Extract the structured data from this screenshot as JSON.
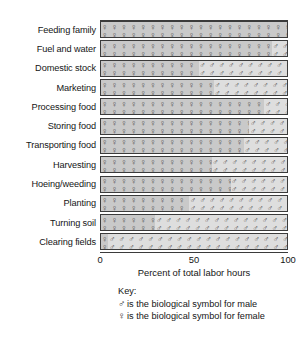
{
  "chart_data": {
    "type": "bar",
    "orientation": "horizontal",
    "stacked": true,
    "title": "",
    "xlabel": "Percent of total labor hours",
    "ylabel": "",
    "xlim": [
      0,
      100
    ],
    "xticks": [
      0,
      50,
      100
    ],
    "xtick_labels": [
      "0",
      "50",
      "100"
    ],
    "grid": false,
    "legend_position": "below-plot",
    "categories": [
      "Feeding family",
      "Fuel and water",
      "Domestic stock",
      "Marketing",
      "Processing food",
      "Storing food",
      "Transporting food",
      "Harvesting",
      "Hoeing/weeding",
      "Planting",
      "Turning soil",
      "Clearing fields"
    ],
    "series": [
      {
        "name": "female",
        "symbol": "♀",
        "values": [
          100,
          92,
          53,
          61,
          88,
          80,
          77,
          60,
          70,
          48,
          30,
          5
        ]
      },
      {
        "name": "male",
        "symbol": "♂",
        "values": [
          0,
          8,
          47,
          39,
          12,
          20,
          23,
          40,
          30,
          52,
          70,
          95
        ]
      }
    ]
  },
  "axis": {
    "xlabel": "Percent of total labor hours",
    "tick_0": "0",
    "tick_50": "50",
    "tick_100": "100"
  },
  "key": {
    "title": "Key:",
    "male_symbol": "♂",
    "male_text": "is the biological symbol for male",
    "female_symbol": "♀",
    "female_text": "is the biological symbol for female"
  },
  "colors": {
    "female_fill": "#c9c9c9",
    "male_fill": "#dedede",
    "border": "#3b3b3b",
    "text": "#151515"
  }
}
